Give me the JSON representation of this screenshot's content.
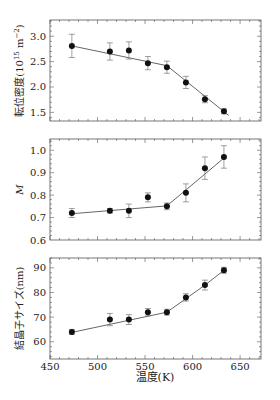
{
  "figure": {
    "xlabel": "温度(K)",
    "x_ticks": [
      450,
      500,
      550,
      600,
      650
    ],
    "xlim": [
      450,
      672
    ]
  },
  "chart_data": [
    {
      "type": "scatter",
      "title": "",
      "xlabel": "温度(K)",
      "ylabel": "転位密度(10^15 m^-2)",
      "ylabel_parts": {
        "base": "転位密度(10",
        "sup1": "15",
        "mid": "m",
        "sup2": "−2",
        "end": ")"
      },
      "xlim": [
        450,
        672
      ],
      "ylim": [
        1.33,
        3.32
      ],
      "y_ticks": [
        1.5,
        2.0,
        2.5,
        3.0
      ],
      "y_tick_labels": [
        "1.5",
        "2.0",
        "2.5",
        "3.0"
      ],
      "grid": false,
      "x": [
        473,
        513,
        533,
        553,
        573,
        593,
        613,
        633
      ],
      "values": [
        2.81,
        2.7,
        2.72,
        2.47,
        2.39,
        2.09,
        1.76,
        1.52
      ],
      "errors": [
        0.23,
        0.17,
        0.17,
        0.13,
        0.12,
        0.12,
        0.07,
        0.05
      ],
      "fit_line": {
        "x": [
          473,
          573,
          638
        ],
        "y": [
          2.81,
          2.42,
          1.44
        ]
      }
    },
    {
      "type": "scatter",
      "title": "",
      "xlabel": "温度(K)",
      "ylabel": "M",
      "xlim": [
        450,
        672
      ],
      "ylim": [
        0.6,
        1.05
      ],
      "y_ticks": [
        0.6,
        0.7,
        0.8,
        0.9,
        1.0
      ],
      "y_tick_labels": [
        "0.6",
        "0.7",
        "0.8",
        "0.9",
        "1.0"
      ],
      "grid": false,
      "x": [
        473,
        513,
        533,
        553,
        573,
        593,
        613,
        633
      ],
      "values": [
        0.72,
        0.73,
        0.73,
        0.79,
        0.75,
        0.81,
        0.92,
        0.97
      ],
      "errors": [
        0.02,
        0.01,
        0.03,
        0.02,
        0.015,
        0.04,
        0.05,
        0.05
      ],
      "fit_line": {
        "x": [
          473,
          573,
          633
        ],
        "y": [
          0.717,
          0.752,
          0.965
        ]
      }
    },
    {
      "type": "scatter",
      "title": "",
      "xlabel": "温度(K)",
      "ylabel": "結晶子サイズ(nm)",
      "xlim": [
        450,
        672
      ],
      "ylim": [
        53,
        94
      ],
      "y_ticks": [
        60,
        70,
        80,
        90
      ],
      "y_tick_labels": [
        "60",
        "70",
        "80",
        "90"
      ],
      "grid": false,
      "x": [
        473,
        513,
        533,
        553,
        573,
        593,
        613,
        633
      ],
      "values": [
        64,
        69,
        69,
        72,
        72,
        78,
        83,
        89
      ],
      "errors": [
        1,
        2.5,
        2,
        1.5,
        1.2,
        1.5,
        2,
        1.2
      ],
      "fit_line": {
        "x": [
          473,
          573,
          593,
          613,
          633
        ],
        "y": [
          63.8,
          72,
          77.5,
          83,
          89
        ]
      }
    }
  ],
  "colors": {
    "axis": "#555555",
    "marker": "#111111",
    "errorbar": "#777777",
    "line": "#555555"
  }
}
